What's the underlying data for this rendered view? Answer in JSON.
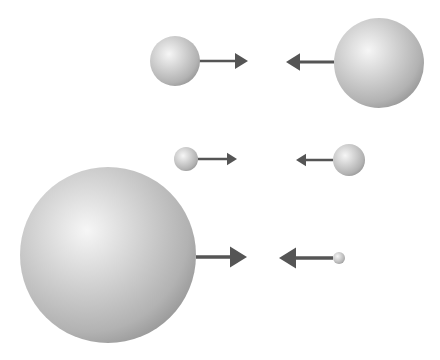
{
  "diagram": {
    "colors": {
      "background": "#ffffff",
      "sphere_highlight": "#f6f6f6",
      "sphere_mid": "#cacaca",
      "sphere_edge": "#9c9c9c",
      "arrow": "#555555"
    },
    "rows": [
      {
        "name": "top-pair",
        "left_sphere": {
          "cx": 175,
          "cy": 61,
          "r": 25
        },
        "right_sphere": {
          "cx": 379,
          "cy": 63,
          "r": 45
        },
        "left_arrow": {
          "x1": 199,
          "x2": 248,
          "y": 61,
          "head": 13
        },
        "right_arrow": {
          "x1": 334,
          "x2": 286,
          "y": 62,
          "head": 14
        }
      },
      {
        "name": "middle-pair",
        "left_sphere": {
          "cx": 186,
          "cy": 159,
          "r": 12
        },
        "right_sphere": {
          "cx": 349,
          "cy": 160,
          "r": 16
        },
        "left_arrow": {
          "x1": 198,
          "x2": 237,
          "y": 159,
          "head": 10
        },
        "right_arrow": {
          "x1": 333,
          "x2": 296,
          "y": 160,
          "head": 10
        }
      },
      {
        "name": "bottom-pair",
        "left_sphere": {
          "cx": 108,
          "cy": 255,
          "r": 88
        },
        "right_sphere": {
          "cx": 339,
          "cy": 258,
          "r": 6
        },
        "left_arrow": {
          "x1": 196,
          "x2": 247,
          "y": 257,
          "head": 17
        },
        "right_arrow": {
          "x1": 333,
          "x2": 279,
          "y": 258,
          "head": 17
        }
      }
    ]
  }
}
